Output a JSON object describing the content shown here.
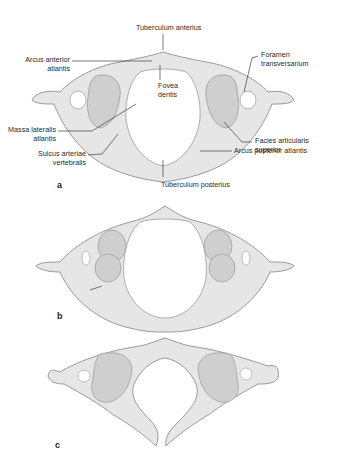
{
  "figure": {
    "panels": [
      {
        "id": "a",
        "letter": "a",
        "labels": {
          "tuberculum_anterius": "Tuberculum anterius",
          "arcus_anterior_1": "Arcus anterior",
          "arcus_anterior_2": "atlantis",
          "fovea_1": "Fovea",
          "fovea_2": "dentis",
          "foramen_1": "Foramen",
          "foramen_2": "transversarium",
          "massa_1": "Massa lateralis",
          "massa_2": "atlantis",
          "facies_1": "Facies articularis",
          "facies_2": "superior",
          "sulcus_1": "Sulcus arteriae",
          "sulcus_2": "vertebralis",
          "arcus_posterior": "Arcus posterior atlantis",
          "tuberculum_posterius": "Tuberculum posterius"
        }
      },
      {
        "id": "b",
        "letter": "b"
      },
      {
        "id": "c",
        "letter": "c"
      }
    ],
    "colors": {
      "bone_fill": "#e6e6e6",
      "bone_stroke": "#9a9a9a",
      "facet_fill": "#cfcfcf",
      "leader_line": "#222222",
      "text": "#2a2a2a"
    }
  }
}
